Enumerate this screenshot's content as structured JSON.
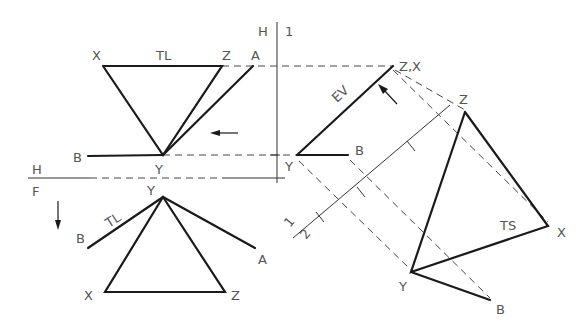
{
  "diagram": {
    "colors": {
      "object_line": "#1a1a1a",
      "construction_line": "#444444",
      "label": "#555555"
    },
    "fold_lines": {
      "h_1": {
        "label_left": "H",
        "label_right": "1"
      },
      "h_f": {
        "label_top": "H",
        "label_bottom": "F"
      },
      "one_two": {
        "label_top": "1",
        "label_bottom": "2"
      }
    },
    "top_view": {
      "labels": {
        "x": "X",
        "z": "Z",
        "a": "A",
        "y": "Y",
        "b": "B",
        "tl": "TL"
      },
      "arrow": "left-arrow"
    },
    "front_view": {
      "labels": {
        "y": "Y",
        "b": "B",
        "a": "A",
        "x": "X",
        "z": "Z",
        "tl": "TL"
      },
      "arrow": "down-arrow"
    },
    "aux_view_1": {
      "labels": {
        "zx": "Z,X",
        "y": "Y",
        "b": "B",
        "ev": "EV"
      },
      "arrow": "perpendicular-arrow"
    },
    "aux_view_2": {
      "labels": {
        "z": "Z",
        "x": "X",
        "y": "Y",
        "b": "B",
        "ts": "TS"
      }
    }
  }
}
